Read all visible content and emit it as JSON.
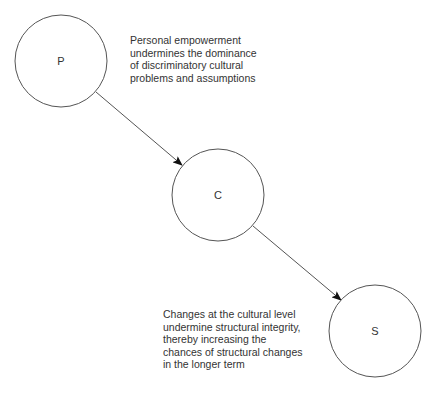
{
  "diagram": {
    "nodes": [
      {
        "id": "P",
        "label": "P",
        "cx": 61,
        "cy": 61,
        "r": 46
      },
      {
        "id": "C",
        "label": "C",
        "cx": 218,
        "cy": 195,
        "r": 46
      },
      {
        "id": "S",
        "label": "S",
        "cx": 375,
        "cy": 331,
        "r": 46
      }
    ],
    "edges": [
      {
        "from": "P",
        "to": "C",
        "x1": 96,
        "y1": 92,
        "x2": 182,
        "y2": 165
      },
      {
        "from": "C",
        "to": "S",
        "x1": 253,
        "y1": 226,
        "x2": 341,
        "y2": 300
      }
    ],
    "captions": {
      "p_to_c": "Personal empowerment\nundermines the dominance\nof discriminatory cultural\nproblems and assumptions",
      "c_to_s": "Changes at the cultural level\nundermine structural integrity,\nthereby increasing the\nchances of structural changes\nin the longer term"
    },
    "colors": {
      "stroke": "#555555",
      "arrowhead": "#111111",
      "text": "#333333",
      "background": "#ffffff"
    }
  }
}
